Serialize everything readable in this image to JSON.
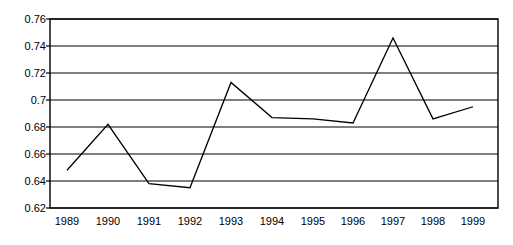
{
  "chart_data": {
    "type": "line",
    "title": "",
    "subtitle": "",
    "xlabel": "",
    "ylabel": "",
    "categories": [
      "1989",
      "1990",
      "1991",
      "1992",
      "1993",
      "1994",
      "1995",
      "1996",
      "1997",
      "1998",
      "1999"
    ],
    "series": [
      {
        "name": "",
        "values": [
          0.648,
          0.682,
          0.638,
          0.635,
          0.713,
          0.687,
          0.686,
          0.683,
          0.746,
          0.686,
          0.695
        ]
      }
    ],
    "ylim": [
      0.62,
      0.76
    ],
    "yticks": [
      "0.76",
      "0.74",
      "0.72",
      "0.7",
      "0.68",
      "0.66",
      "0.64",
      "0.62"
    ],
    "ytick_values": [
      0.76,
      0.74,
      0.72,
      0.7,
      0.68,
      0.66,
      0.64,
      0.62
    ],
    "xticks": [
      "1989",
      "1990",
      "1991",
      "1992",
      "1993",
      "1994",
      "1995",
      "1996",
      "1997",
      "1998",
      "1999"
    ],
    "grid": "horizontal",
    "legend": "none",
    "line_color": "#000000",
    "grid_color": "#000000",
    "axis_color": "#000000",
    "plot_background": "#ffffff",
    "markers": "none"
  },
  "plot_geometry": {
    "left": 50,
    "right": 498,
    "top": 19,
    "bottom": 208,
    "x_positions": [
      67,
      108,
      149,
      190,
      231,
      272,
      313,
      353,
      393,
      433,
      473
    ],
    "y_positions": [
      184,
      131,
      196,
      200,
      86,
      123,
      125,
      131,
      37,
      127,
      115
    ],
    "gridline_y": [
      19,
      46,
      73,
      100,
      127,
      154,
      181,
      208
    ],
    "ylabel_right_x": 46,
    "xlabel_y": 225
  }
}
